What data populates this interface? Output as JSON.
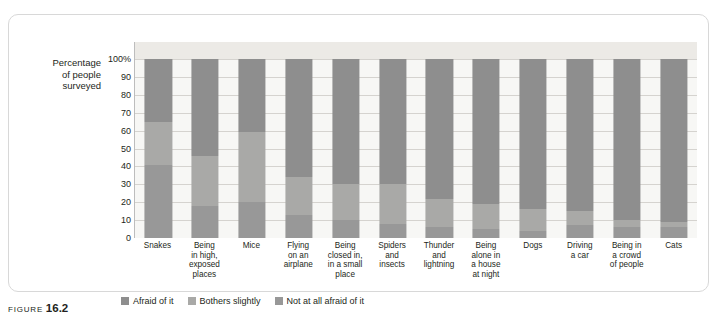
{
  "figure": {
    "caption_word": "FIGURE",
    "caption_number": "16.2"
  },
  "chart_data": {
    "type": "bar",
    "subtype": "stacked-column-100",
    "title": "",
    "xlabel": "",
    "ylabel": "Percentage of people surveyed",
    "ylim": [
      0,
      100
    ],
    "yticks": [
      "100%",
      "90",
      "80",
      "70",
      "60",
      "50",
      "40",
      "30",
      "20",
      "10",
      "0"
    ],
    "grid": true,
    "legend_position": "bottom",
    "categories": [
      "Snakes",
      "Being in high, exposed places",
      "Mice",
      "Flying on an airplane",
      "Being closed in, in a small place",
      "Spiders and insects",
      "Thunder and lightning",
      "Being alone in a house at night",
      "Dogs",
      "Driving a car",
      "Being in a crowd of people",
      "Cats"
    ],
    "series": [
      {
        "name": "Afraid of it",
        "color": "#8e8e8e",
        "values": [
          35,
          54,
          41,
          66,
          70,
          70,
          78,
          81,
          84,
          85,
          90,
          91
        ]
      },
      {
        "name": "Bothers slightly",
        "color": "#a9a9a7",
        "values": [
          24,
          28,
          39,
          21,
          20,
          22,
          16,
          14,
          12,
          8,
          4,
          3
        ]
      },
      {
        "name": "Not at all afraid of it",
        "color": "#989898",
        "values": [
          41,
          18,
          20,
          13,
          10,
          8,
          6,
          5,
          4,
          7,
          6,
          6
        ]
      }
    ]
  },
  "axis": {
    "tick_0": "100%",
    "tick_1": "90",
    "tick_2": "80",
    "tick_3": "70",
    "tick_4": "60",
    "tick_5": "50",
    "tick_6": "40",
    "tick_7": "30",
    "tick_8": "20",
    "tick_9": "10",
    "tick_10": "0"
  },
  "ylabel_lines": [
    "Percentage",
    "of people",
    "surveyed"
  ],
  "categories_lines": [
    [
      "Snakes"
    ],
    [
      "Being",
      "in high,",
      "exposed",
      "places"
    ],
    [
      "Mice"
    ],
    [
      "Flying",
      "on an",
      "airplane"
    ],
    [
      "Being",
      "closed in,",
      "in a small",
      "place"
    ],
    [
      "Spiders",
      "and",
      "insects"
    ],
    [
      "Thunder",
      "and",
      "lightning"
    ],
    [
      "Being",
      "alone in",
      "a house",
      "at night"
    ],
    [
      "Dogs"
    ],
    [
      "Driving",
      "a car"
    ],
    [
      "Being in",
      "a crowd",
      "of people"
    ],
    [
      "Cats"
    ]
  ]
}
